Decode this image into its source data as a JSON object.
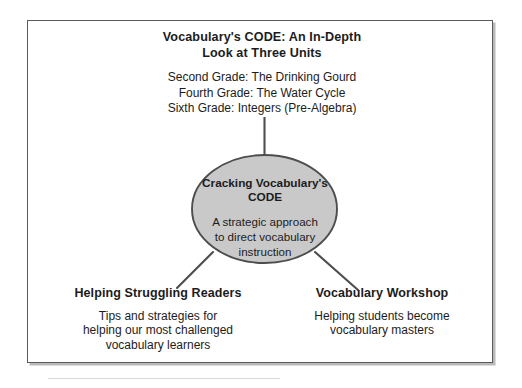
{
  "diagram": {
    "type": "concept-map",
    "center": {
      "title_line_1": "Cracking Vocabulary's",
      "title_line_2": "CODE",
      "body_line_1": "A strategic approach",
      "body_line_2": "to direct vocabulary",
      "body_line_3": "instruction",
      "fill_color": "#c9c9c9",
      "stroke_color": "#4d4d4d"
    },
    "branches": [
      {
        "position": "top",
        "heading_line_1": "Vocabulary's CODE: An In-Depth",
        "heading_line_2": "Look at Three Units",
        "items": [
          "Second Grade: The Drinking Gourd",
          "Fourth Grade: The Water Cycle",
          "Sixth Grade: Integers (Pre-Algebra)"
        ]
      },
      {
        "position": "bottom-left",
        "heading": "Helping Struggling Readers",
        "body_line_1": "Tips and strategies for",
        "body_line_2": "helping our most challenged",
        "body_line_3": "vocabulary learners"
      },
      {
        "position": "bottom-right",
        "heading": "Vocabulary Workshop",
        "body_line_1": "Helping students become",
        "body_line_2": "vocabulary masters"
      }
    ],
    "connector_color": "#4d4d4d",
    "frame_color": "#5a5a5a",
    "background_color": "#ffffff"
  }
}
